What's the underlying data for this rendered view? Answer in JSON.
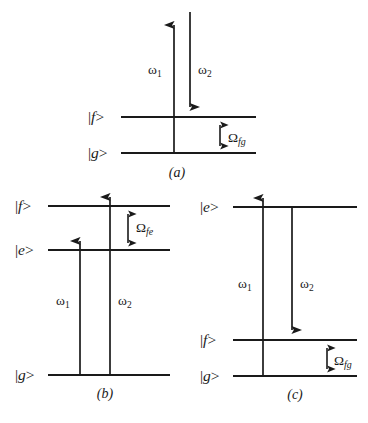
{
  "figure": {
    "colors": {
      "ink": "#1a1a1a",
      "background": "#ffffff"
    },
    "panels": [
      {
        "id": "a",
        "caption": "(a)",
        "levels": [
          {
            "name": "f",
            "label_bra": "|",
            "label_state": "f",
            "label_ket": ">"
          },
          {
            "name": "g",
            "label_bra": "|",
            "label_state": "g",
            "label_ket": ">"
          }
        ],
        "transitions": [
          {
            "name": "omega1",
            "symbol": "ω",
            "sub": "1",
            "direction": "up"
          },
          {
            "name": "omega2",
            "symbol": "ω",
            "sub": "2",
            "direction": "down"
          }
        ],
        "gap": {
          "name": "omega-fg",
          "symbol": "Ω",
          "sub": "fg",
          "between": [
            "f",
            "g"
          ]
        }
      },
      {
        "id": "b",
        "caption": "(b)",
        "levels": [
          {
            "name": "f",
            "label_bra": "|",
            "label_state": "f",
            "label_ket": ">"
          },
          {
            "name": "e",
            "label_bra": "|",
            "label_state": "e",
            "label_ket": ">"
          },
          {
            "name": "g",
            "label_bra": "|",
            "label_state": "g",
            "label_ket": ">"
          }
        ],
        "transitions": [
          {
            "name": "omega1",
            "symbol": "ω",
            "sub": "1",
            "direction": "up"
          },
          {
            "name": "omega2",
            "symbol": "ω",
            "sub": "2",
            "direction": "up"
          }
        ],
        "gap": {
          "name": "omega-fe",
          "symbol": "Ω",
          "sub": "fe",
          "between": [
            "f",
            "e"
          ]
        }
      },
      {
        "id": "c",
        "caption": "(c)",
        "levels": [
          {
            "name": "e",
            "label_bra": "|",
            "label_state": "e",
            "label_ket": ">"
          },
          {
            "name": "f",
            "label_bra": "|",
            "label_state": "f",
            "label_ket": ">"
          },
          {
            "name": "g",
            "label_bra": "|",
            "label_state": "g",
            "label_ket": ">"
          }
        ],
        "transitions": [
          {
            "name": "omega1",
            "symbol": "ω",
            "sub": "1",
            "direction": "up"
          },
          {
            "name": "omega2",
            "symbol": "ω",
            "sub": "2",
            "direction": "down"
          }
        ],
        "gap": {
          "name": "omega-fg",
          "symbol": "Ω",
          "sub": "fg",
          "between": [
            "f",
            "g"
          ]
        }
      }
    ]
  },
  "panel_a": {
    "level_f": "f",
    "level_f_bra": "|",
    "level_f_ket": ">",
    "level_g": "g",
    "level_g_bra": "|",
    "level_g_ket": ">",
    "omega1": "ω",
    "omega1_sub": "1",
    "omega2": "ω",
    "omega2_sub": "2",
    "gap_symbol": "Ω",
    "gap_sub": "fg",
    "caption": "(a)"
  },
  "panel_b": {
    "level_f": "f",
    "level_f_bra": "|",
    "level_f_ket": ">",
    "level_e": "e",
    "level_e_bra": "|",
    "level_e_ket": ">",
    "level_g": "g",
    "level_g_bra": "|",
    "level_g_ket": ">",
    "omega1": "ω",
    "omega1_sub": "1",
    "omega2": "ω",
    "omega2_sub": "2",
    "gap_symbol": "Ω",
    "gap_sub": "fe",
    "caption": "(b)"
  },
  "panel_c": {
    "level_e": "e",
    "level_e_bra": "|",
    "level_e_ket": ">",
    "level_f": "f",
    "level_f_bra": "|",
    "level_f_ket": ">",
    "level_g": "g",
    "level_g_bra": "|",
    "level_g_ket": ">",
    "omega1": "ω",
    "omega1_sub": "1",
    "omega2": "ω",
    "omega2_sub": "2",
    "gap_symbol": "Ω",
    "gap_sub": "fg",
    "caption": "(c)"
  }
}
